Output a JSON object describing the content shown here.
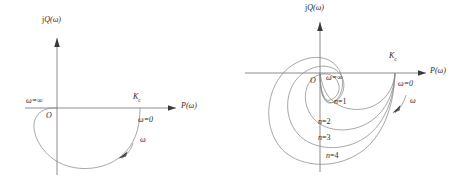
{
  "figure": {
    "background": "#ffffff",
    "line_color": "#8a8a8a",
    "axis_color": "#6f6f6f",
    "text_color": "#2b2b2b"
  },
  "panels": [
    {
      "id": "left",
      "caption": "Nyquist plot single loop",
      "axes": {
        "y_label_prefix": "j",
        "y_label_var": "Q",
        "y_label_arg": "(ω)",
        "x_label_var": "P",
        "x_label_arg": "(ω)",
        "origin_label": "O"
      },
      "annotations": [
        {
          "name": "omega-infinity",
          "text": "ω=∞"
        },
        {
          "name": "kc",
          "base": "K",
          "sub": "c"
        },
        {
          "name": "omega-zero",
          "text": "ω=0"
        },
        {
          "name": "omega-direction",
          "text": "ω"
        }
      ]
    },
    {
      "id": "right",
      "caption": "Nyquist plot nested loops n=1..4",
      "axes": {
        "y_label_prefix": "j",
        "y_label_var": "Q",
        "y_label_arg": "(ω)",
        "x_label_var": "P",
        "x_label_arg": "(ω)",
        "origin_label": "O"
      },
      "annotations": [
        {
          "name": "omega-infinity",
          "text": "ω=∞"
        },
        {
          "name": "kc",
          "base": "K",
          "sub": "c"
        },
        {
          "name": "omega-zero",
          "text": "ω=0"
        },
        {
          "name": "omega-direction",
          "text": "ω"
        }
      ],
      "curve_labels": [
        {
          "name": "n1",
          "var": "n",
          "text": "=1"
        },
        {
          "name": "n2",
          "var": "n",
          "text": "=2"
        },
        {
          "name": "n3",
          "var": "n",
          "text": "=3"
        },
        {
          "name": "n4",
          "var": "n",
          "text": "=4"
        }
      ]
    }
  ]
}
